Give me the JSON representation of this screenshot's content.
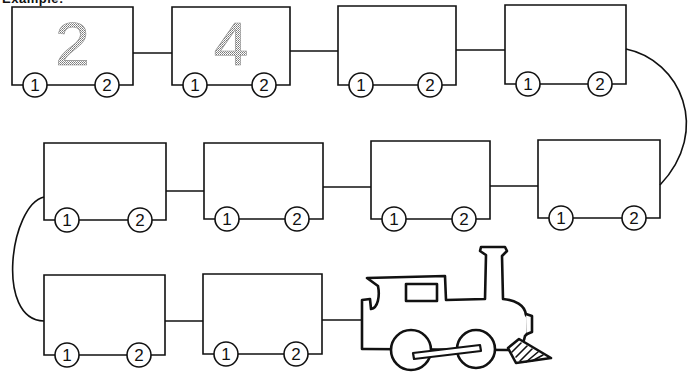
{
  "worksheet": {
    "header_label": "Example:",
    "colors": {
      "ink": "#111111",
      "example_digit": "#8a8a8a",
      "background": "#ffffff"
    },
    "cars": [
      {
        "id": 1,
        "row": 1,
        "x": 12,
        "y": 7,
        "w": 121,
        "h": 78,
        "number": "2",
        "wheel_left": "1",
        "wheel_right": "2"
      },
      {
        "id": 2,
        "row": 1,
        "x": 172,
        "y": 7,
        "w": 118,
        "h": 78,
        "number": "4",
        "wheel_left": "1",
        "wheel_right": "2"
      },
      {
        "id": 3,
        "row": 1,
        "x": 338,
        "y": 6,
        "w": 118,
        "h": 79,
        "number": "",
        "wheel_left": "1",
        "wheel_right": "2"
      },
      {
        "id": 4,
        "row": 1,
        "x": 505,
        "y": 5,
        "w": 121,
        "h": 79,
        "number": "",
        "wheel_left": "1",
        "wheel_right": "2"
      },
      {
        "id": 5,
        "row": 2,
        "x": 44,
        "y": 143,
        "w": 122,
        "h": 77,
        "number": "",
        "wheel_left": "1",
        "wheel_right": "2"
      },
      {
        "id": 6,
        "row": 2,
        "x": 204,
        "y": 143,
        "w": 119,
        "h": 76,
        "number": "",
        "wheel_left": "1",
        "wheel_right": "2"
      },
      {
        "id": 7,
        "row": 2,
        "x": 371,
        "y": 141,
        "w": 119,
        "h": 78,
        "number": "",
        "wheel_left": "1",
        "wheel_right": "2"
      },
      {
        "id": 8,
        "row": 2,
        "x": 538,
        "y": 140,
        "w": 122,
        "h": 78,
        "number": "",
        "wheel_left": "1",
        "wheel_right": "2"
      },
      {
        "id": 9,
        "row": 3,
        "x": 44,
        "y": 275,
        "w": 121,
        "h": 80,
        "number": "",
        "wheel_left": "1",
        "wheel_right": "2"
      },
      {
        "id": 10,
        "row": 3,
        "x": 203,
        "y": 274,
        "w": 119,
        "h": 80,
        "number": "",
        "wheel_left": "1",
        "wheel_right": "2"
      }
    ],
    "locomotive": {
      "label": "steam-locomotive",
      "x": 360,
      "y": 246
    }
  }
}
